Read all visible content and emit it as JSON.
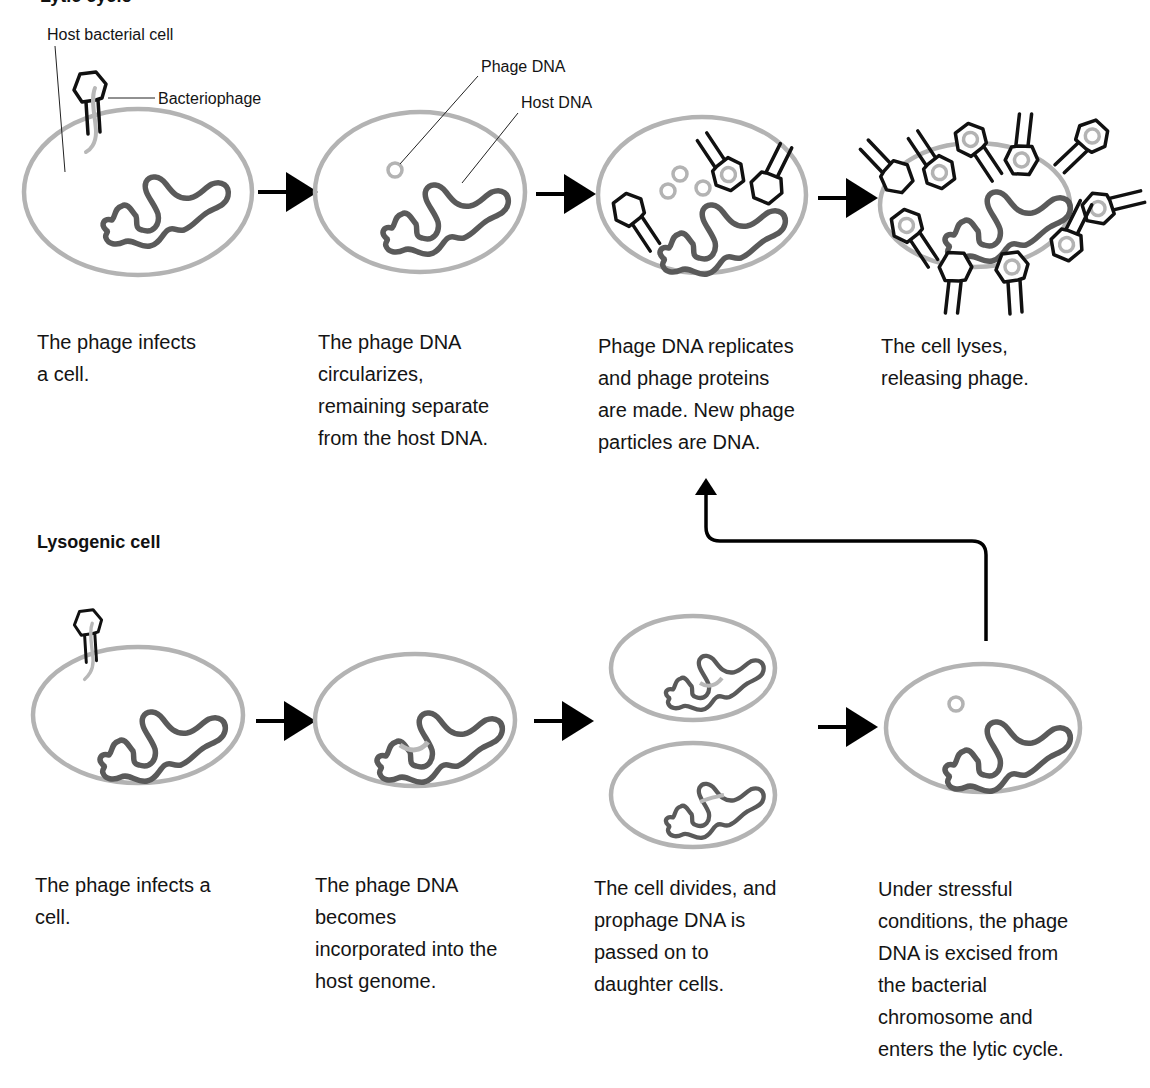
{
  "lytic": {
    "title": "Lytic cycle",
    "labels": {
      "host_cell": "Host bacterial cell",
      "bacteriophage": "Bacteriophage",
      "phage_dna": "Phage DNA",
      "host_dna": "Host DNA"
    },
    "steps": [
      {
        "caption": "The phage infects\na cell."
      },
      {
        "caption": "The phage DNA\ncircularizes,\nremaining separate\nfrom the host DNA."
      },
      {
        "caption": "Phage DNA replicates\nand phage proteins\nare made. New phage\nparticles are DNA."
      },
      {
        "caption": "The cell lyses,\nreleasing phage."
      }
    ]
  },
  "lysogenic": {
    "title": "Lysogenic cell",
    "steps": [
      {
        "caption": "The phage infects a\ncell."
      },
      {
        "caption": "The phage DNA\nbecomes\nincorporated into the\nhost genome."
      },
      {
        "caption": "The cell divides, and\nprophage DNA is\npassed on to\ndaughter cells."
      },
      {
        "caption": "Under stressful\nconditions, the phage\nDNA is excised from\nthe bacterial\nchromosome and\nenters the lytic cycle."
      }
    ]
  },
  "colors": {
    "cell_membrane": "#b3b3b3",
    "host_dna": "#5a5a5a",
    "phage_dna": "#b8b8b8",
    "phage_outline": "#111111",
    "arrow": "#000000"
  }
}
